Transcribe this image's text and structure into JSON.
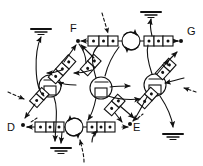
{
  "diagram": {
    "type": "schematic-network-diagram",
    "title": "",
    "canvas": {
      "width": 203,
      "height": 166
    },
    "ink_color": "#111111",
    "background_color": "#ffffff",
    "terminal_nodes": [
      {
        "id": "F",
        "label": "F",
        "label_x": 72,
        "label_y": 26,
        "dot_x": 78,
        "dot_y": 41
      },
      {
        "id": "G",
        "label": "G",
        "label_x": 186,
        "label_y": 28,
        "dot_x": 181,
        "dot_y": 41
      },
      {
        "id": "D",
        "label": "D",
        "label_x": 8,
        "label_y": 127,
        "dot_x": 23,
        "dot_y": 127
      },
      {
        "id": "E",
        "label": "E",
        "label_x": 133,
        "label_y": 128,
        "dot_x": 129,
        "dot_y": 127
      }
    ],
    "hub_nodes": [
      {
        "id": "hub-left",
        "cx": 50,
        "cy": 86,
        "r": 11
      },
      {
        "id": "hub-center",
        "cx": 101,
        "cy": 88,
        "r": 11
      },
      {
        "id": "hub-right",
        "cx": 155,
        "cy": 85,
        "r": 11
      },
      {
        "id": "hub-top",
        "cx": 0,
        "cy": 0,
        "r": 0
      }
    ],
    "rotation_symbols": [
      {
        "id": "rotation-top",
        "cx": 131,
        "cy": 41,
        "r": 9,
        "direction": "clockwise"
      },
      {
        "id": "rotation-bottom",
        "cx": 74,
        "cy": 127,
        "r": 9,
        "direction": "counter-clockwise"
      }
    ],
    "ground_symbols": [
      {
        "id": "ground-upper-left",
        "x": 41,
        "y": 28
      },
      {
        "id": "ground-top-right",
        "x": 150,
        "y": 12
      },
      {
        "id": "ground-bottom-left",
        "x": 60,
        "y": 148
      },
      {
        "id": "ground-right",
        "x": 172,
        "y": 134
      }
    ],
    "element_chains": [
      {
        "id": "chain-top",
        "orientation": "horizontal",
        "cells": 6,
        "x1": 88,
        "y1": 41,
        "x2": 172,
        "y2": 41
      },
      {
        "id": "chain-bottom",
        "orientation": "horizontal",
        "cells": 6,
        "x1": 35,
        "y1": 127,
        "x2": 122,
        "y2": 127
      },
      {
        "id": "chain-nw",
        "orientation": "diagonal",
        "cells": 3,
        "x1": 33,
        "y1": 100,
        "x2": 72,
        "y2": 56
      },
      {
        "id": "chain-ne",
        "orientation": "diagonal",
        "cells": 3,
        "x1": 140,
        "y1": 104,
        "x2": 175,
        "y2": 58
      },
      {
        "id": "chain-center",
        "orientation": "diagonal",
        "cells": 3,
        "x1": 84,
        "y1": 62,
        "x2": 117,
        "y2": 114
      }
    ],
    "arrow_count": 18,
    "dashed_arrow_count": 4
  },
  "labels": {
    "F": "F",
    "G": "G",
    "D": "D",
    "E": "E"
  }
}
